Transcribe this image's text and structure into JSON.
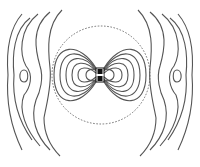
{
  "diagram": {
    "type": "field-line-plot",
    "center": [
      100,
      75
    ],
    "boundary_circle": {
      "style": "dashed",
      "radius": 49
    },
    "source": {
      "shape": "dipole-antenna",
      "color": "#111111"
    },
    "line_color": "#555555",
    "inner_lobes": 7,
    "outer_loops_per_side": 4
  }
}
